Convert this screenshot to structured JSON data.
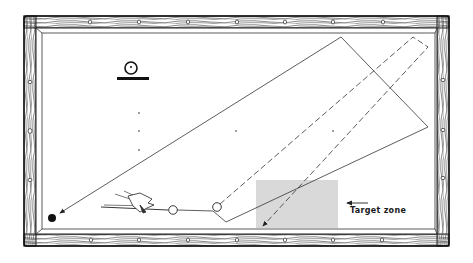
{
  "diagram": {
    "type": "billiards-table-shot-diagram",
    "colors": {
      "background": "#ffffff",
      "rail_wood": "#ffffff",
      "rail_grain": "#333333",
      "rail_outline": "#222222",
      "felt": "#ffffff",
      "ink": "#2a2a2a",
      "target_zone_fill": "#d9d9d9"
    },
    "target_zone": {
      "label": "Target zone",
      "rect": {
        "x": 256,
        "y": 180,
        "w": 82,
        "h": 48
      }
    },
    "balls": {
      "cue_ball": {
        "cx": 173,
        "cy": 210,
        "r": 4.3
      },
      "object_ball": {
        "cx": 217,
        "cy": 207,
        "r": 4.3
      },
      "pocketed_ball": {
        "cx": 52,
        "cy": 218,
        "r": 4
      }
    },
    "legend_icon": "ball-on-rail-icon",
    "diamonds": {
      "top": [
        90,
        139,
        188,
        237,
        285,
        333,
        383
      ],
      "bottom": [
        91,
        139,
        188,
        237,
        285,
        333,
        382
      ],
      "left": [
        82,
        131,
        180
      ],
      "right": [
        80,
        130,
        178
      ]
    }
  }
}
